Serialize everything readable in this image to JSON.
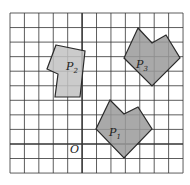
{
  "diagram": {
    "origin_label": "O",
    "grid": {
      "cols": 12,
      "rows": 11,
      "x0": 10,
      "y0": 13,
      "dx": 14.42,
      "dy": 14.55,
      "axis_col": 5,
      "axis_row": 9
    },
    "colors": {
      "grid": "#333333",
      "fill": "#9a9a9a",
      "fill_light": "#c2c2c2",
      "stroke": "#2a2a2a"
    },
    "polygons": [
      {
        "id": "P1",
        "name": "P",
        "sub": "1",
        "points": "110,100 124,114 138,107 152,129 124,158 96,129",
        "label_x": 109,
        "label_y": 136
      },
      {
        "id": "P2",
        "name": "P",
        "sub": "2",
        "points": "56,45 85,51 80,97 55,97 58,74 47,69",
        "label_x": 66,
        "label_y": 70
      },
      {
        "id": "P3",
        "name": "P",
        "sub": "3",
        "points": "138,28 152,43 166,35 180,58 152,86 124,58",
        "label_x": 136,
        "label_y": 68
      }
    ]
  }
}
